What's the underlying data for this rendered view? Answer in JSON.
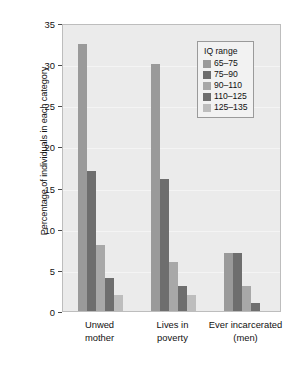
{
  "chart_data": {
    "type": "bar",
    "title": "",
    "subtitle": "",
    "xlabel": "",
    "ylabel": "Percentage of individuals in each category",
    "categories": [
      "Unwed\nmother",
      "Lives in\npoverty",
      "Ever incarcerated\n(men)"
    ],
    "category_lines": [
      [
        "Unwed",
        "mother"
      ],
      [
        "Lives in",
        "poverty"
      ],
      [
        "Ever incarcerated",
        "(men)"
      ]
    ],
    "ylim": [
      0,
      35
    ],
    "yticks": [
      0,
      5,
      10,
      15,
      20,
      25,
      30,
      35
    ],
    "ytick_labels": [
      "0",
      "5",
      "10",
      "15",
      "20",
      "25",
      "30",
      "35"
    ],
    "grid": true,
    "legend_position": "upper right",
    "legend_title": "IQ range",
    "series": [
      {
        "name": "65–75",
        "color": "#9a9a9a",
        "values": [
          32.5,
          30.0,
          7.0
        ]
      },
      {
        "name": "75–90",
        "color": "#6e6e6e",
        "values": [
          17.0,
          16.0,
          7.0
        ]
      },
      {
        "name": "90–110",
        "color": "#a8a8a8",
        "values": [
          8.0,
          6.0,
          3.0
        ]
      },
      {
        "name": "110–125",
        "color": "#6e6e6e",
        "values": [
          4.0,
          3.0,
          1.0
        ]
      },
      {
        "name": "125–135",
        "color": "#bdbdbd",
        "values": [
          2.0,
          2.0,
          0.0
        ]
      }
    ],
    "colors": {
      "plot_background": "#ebebeb",
      "figure_background": "#ffffff",
      "gridline": "#f4f4f4",
      "axis": "#4a4a4a",
      "text": "#111111",
      "legend_background": "#f2f2f2",
      "legend_border": "#9a9a9a"
    }
  }
}
